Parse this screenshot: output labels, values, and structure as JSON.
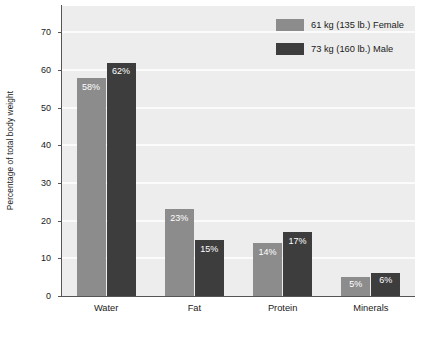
{
  "chart_data": {
    "type": "bar",
    "title": "",
    "subtitle": "",
    "xlabel": "",
    "ylabel": "Percentage of total body weight",
    "categories": [
      "Water",
      "Fat",
      "Protein",
      "Minerals"
    ],
    "series": [
      {
        "name": "61 kg (135 lb.) Female",
        "color": "#8c8c8c",
        "values": [
          58,
          23,
          14,
          5
        ],
        "value_labels": [
          "58%",
          "23%",
          "14%",
          "5%"
        ]
      },
      {
        "name": "73 kg (160 lb.) Male",
        "color": "#3d3d3d",
        "values": [
          62,
          15,
          17,
          6
        ],
        "value_labels": [
          "62%",
          "15%",
          "17%",
          "6%"
        ]
      }
    ],
    "ylim": [
      0,
      77
    ],
    "yticks": [
      0,
      10,
      20,
      30,
      40,
      50,
      60,
      70
    ],
    "ytick_labels": [
      "0",
      "10",
      "20",
      "30",
      "40",
      "50",
      "60",
      "70"
    ],
    "grid": "horizontal-white-gridlines",
    "legend_position": "top-right",
    "plot_background": "#ededed",
    "gridline_color": "#fbfbfb",
    "axis_color": "#555555",
    "value_label_color": "#ffffff",
    "grouped": true
  },
  "legend": {
    "items": [
      {
        "label": "61 kg (135 lb.) Female",
        "color": "#8c8c8c"
      },
      {
        "label": "73 kg (160 lb.) Male",
        "color": "#3d3d3d"
      }
    ]
  }
}
